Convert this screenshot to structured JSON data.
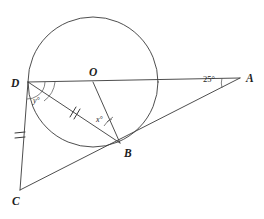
{
  "figure": {
    "background_color": "#ffffff",
    "line_color": "#3a3a3a",
    "label_color": "#1d1d1d"
  },
  "points": {
    "A": {
      "label": "A",
      "x": 240,
      "y": 78,
      "label_x": 246,
      "label_y": 78
    },
    "B": {
      "label": "B",
      "x": 120,
      "y": 143,
      "label_x": 124,
      "label_y": 156
    },
    "C": {
      "label": "C",
      "x": 20,
      "y": 190,
      "label_x": 14,
      "label_y": 203
    },
    "D": {
      "label": "D",
      "x": 28,
      "y": 82,
      "label_x": 14,
      "label_y": 85
    },
    "O": {
      "label": "O",
      "x": 93,
      "y": 82,
      "label_x": 90,
      "label_y": 75
    }
  },
  "circle": {
    "center_x": 93,
    "center_y": 82,
    "radius": 65,
    "name": "circle-O"
  },
  "segments": [
    {
      "name": "segment-DA",
      "from": "D",
      "to": "A"
    },
    {
      "name": "segment-DC",
      "from": "D",
      "to": "C"
    },
    {
      "name": "segment-DB",
      "from": "D",
      "to": "B"
    },
    {
      "name": "segment-OB",
      "from": "O",
      "to": "B"
    },
    {
      "name": "segment-CA",
      "from": "C",
      "to": "A"
    }
  ],
  "angle_labels": {
    "at_A": {
      "text": "25°",
      "x": 208,
      "y": 78
    },
    "at_B": {
      "text": "x°",
      "x": 100,
      "y": 120
    },
    "at_D": {
      "text": "y°",
      "x": 35,
      "y": 100
    }
  },
  "tick_marks": [
    {
      "name": "tick-segment-DC",
      "count": 2,
      "x": 20,
      "y": 136
    },
    {
      "name": "tick-segment-DB",
      "count": 2,
      "x": 73,
      "y": 112
    }
  ],
  "arcs": [
    {
      "name": "angle-arc-D-outer"
    },
    {
      "name": "angle-arc-D-inner"
    },
    {
      "name": "angle-arc-B"
    },
    {
      "name": "angle-arc-A"
    }
  ]
}
